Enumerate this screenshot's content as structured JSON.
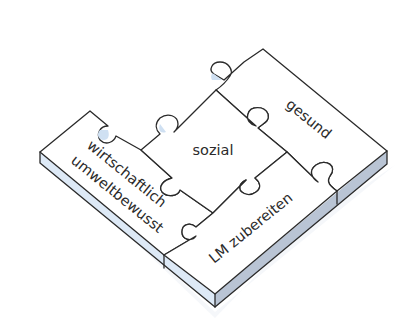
{
  "diagram": {
    "type": "isometric-puzzle",
    "pieces": [
      {
        "id": "gesund",
        "label": "gesund"
      },
      {
        "id": "sozial",
        "label": "sozial"
      },
      {
        "id": "wirtschaftlich",
        "label_line1": "wirtschaftlich",
        "label_line2": "umweltbewusst"
      },
      {
        "id": "lm",
        "label": "LM zubereiten"
      }
    ],
    "colors": {
      "top_face": "#ffffff",
      "left_side": "#dde9f6",
      "right_side": "#b9c4d4",
      "outline": "#2a2a2a",
      "tab_shadow": "#cfe0f2"
    }
  }
}
